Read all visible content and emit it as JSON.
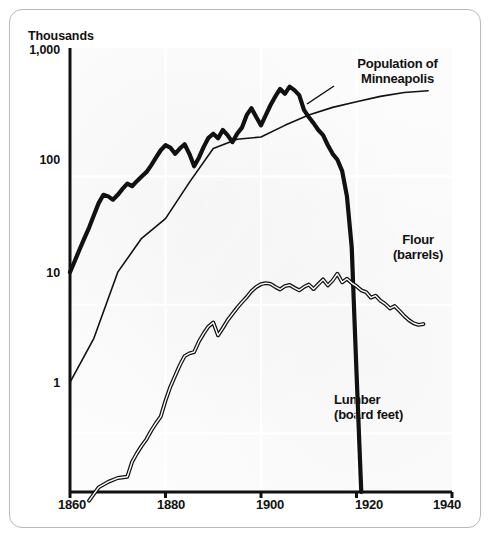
{
  "figure": {
    "border_color": "#b9b9b9",
    "background": "#ffffff"
  },
  "chart_data": {
    "type": "line",
    "title": "",
    "subtitle": "",
    "xlabel": "",
    "ylabel": "Thousands",
    "yscale": "log",
    "ylim": [
      0.35,
      1000
    ],
    "xlim": [
      1860,
      1940
    ],
    "grid": true,
    "legend_position": "inline-annotations",
    "y_ticks": [
      {
        "value": 1,
        "label": "1"
      },
      {
        "value": 10,
        "label": "10"
      },
      {
        "value": 100,
        "label": "100"
      },
      {
        "value": 1000,
        "label": "1,000"
      }
    ],
    "x_ticks": [
      {
        "value": 1860,
        "label": "1860"
      },
      {
        "value": 1880,
        "label": "1880"
      },
      {
        "value": 1900,
        "label": "1900"
      },
      {
        "value": 1920,
        "label": "1920"
      },
      {
        "value": 1940,
        "label": "1940"
      }
    ],
    "series": [
      {
        "name": "Lumber (board feet)",
        "label_line1": "Lumber",
        "label_line2": "(board feet)",
        "color": "#111111",
        "style": "thick-solid",
        "linewidth": 4.2,
        "points": [
          [
            1860,
            18
          ],
          [
            1861,
            22
          ],
          [
            1862,
            27
          ],
          [
            1863,
            33
          ],
          [
            1864,
            40
          ],
          [
            1865,
            50
          ],
          [
            1866,
            62
          ],
          [
            1867,
            72
          ],
          [
            1868,
            70
          ],
          [
            1869,
            66
          ],
          [
            1870,
            72
          ],
          [
            1871,
            80
          ],
          [
            1872,
            88
          ],
          [
            1873,
            84
          ],
          [
            1874,
            92
          ],
          [
            1875,
            100
          ],
          [
            1876,
            108
          ],
          [
            1877,
            122
          ],
          [
            1878,
            140
          ],
          [
            1879,
            160
          ],
          [
            1880,
            175
          ],
          [
            1881,
            168
          ],
          [
            1882,
            150
          ],
          [
            1883,
            165
          ],
          [
            1884,
            178
          ],
          [
            1885,
            150
          ],
          [
            1886,
            120
          ],
          [
            1887,
            140
          ],
          [
            1888,
            170
          ],
          [
            1889,
            200
          ],
          [
            1890,
            215
          ],
          [
            1891,
            198
          ],
          [
            1892,
            230
          ],
          [
            1893,
            210
          ],
          [
            1894,
            185
          ],
          [
            1895,
            215
          ],
          [
            1896,
            240
          ],
          [
            1897,
            300
          ],
          [
            1898,
            340
          ],
          [
            1899,
            290
          ],
          [
            1900,
            250
          ],
          [
            1901,
            300
          ],
          [
            1902,
            360
          ],
          [
            1903,
            420
          ],
          [
            1904,
            480
          ],
          [
            1905,
            440
          ],
          [
            1906,
            500
          ],
          [
            1907,
            470
          ],
          [
            1908,
            430
          ],
          [
            1909,
            330
          ],
          [
            1910,
            290
          ],
          [
            1911,
            260
          ],
          [
            1912,
            230
          ],
          [
            1913,
            210
          ],
          [
            1914,
            175
          ],
          [
            1915,
            150
          ],
          [
            1916,
            135
          ],
          [
            1917,
            110
          ],
          [
            1918,
            70
          ],
          [
            1919,
            28
          ],
          [
            1920,
            3
          ],
          [
            1921,
            0.35
          ]
        ]
      },
      {
        "name": "Population of Minneapolis",
        "label_line1": "Population of",
        "label_line2": "Minneapolis",
        "color": "#111111",
        "style": "thin-solid",
        "linewidth": 1.6,
        "points": [
          [
            1860,
            2.5
          ],
          [
            1865,
            5.5
          ],
          [
            1870,
            18
          ],
          [
            1875,
            33
          ],
          [
            1880,
            47
          ],
          [
            1885,
            90
          ],
          [
            1890,
            165
          ],
          [
            1895,
            195
          ],
          [
            1900,
            203
          ],
          [
            1905,
            250
          ],
          [
            1910,
            301
          ],
          [
            1915,
            345
          ],
          [
            1920,
            381
          ],
          [
            1925,
            420
          ],
          [
            1930,
            450
          ],
          [
            1935,
            465
          ]
        ]
      },
      {
        "name": "Flour (barrels)",
        "label_line1": "Flour",
        "label_line2": "(barrels)",
        "color": "#111111",
        "style": "double-outline",
        "linewidth": 2.6,
        "points": [
          [
            1864,
            0.3
          ],
          [
            1866,
            0.38
          ],
          [
            1868,
            0.42
          ],
          [
            1870,
            0.45
          ],
          [
            1872,
            0.46
          ],
          [
            1873,
            0.6
          ],
          [
            1874,
            0.7
          ],
          [
            1875,
            0.8
          ],
          [
            1876,
            0.9
          ],
          [
            1877,
            1.05
          ],
          [
            1878,
            1.2
          ],
          [
            1879,
            1.35
          ],
          [
            1880,
            1.8
          ],
          [
            1881,
            2.3
          ],
          [
            1882,
            2.8
          ],
          [
            1883,
            3.4
          ],
          [
            1884,
            4.0
          ],
          [
            1885,
            4.2
          ],
          [
            1886,
            4.3
          ],
          [
            1887,
            5.2
          ],
          [
            1888,
            6.0
          ],
          [
            1889,
            6.8
          ],
          [
            1890,
            7.3
          ],
          [
            1891,
            5.8
          ],
          [
            1892,
            6.6
          ],
          [
            1893,
            7.6
          ],
          [
            1894,
            8.5
          ],
          [
            1895,
            9.5
          ],
          [
            1896,
            10.5
          ],
          [
            1897,
            11.5
          ],
          [
            1898,
            12.8
          ],
          [
            1899,
            13.8
          ],
          [
            1900,
            14.5
          ],
          [
            1901,
            14.8
          ],
          [
            1902,
            14.6
          ],
          [
            1903,
            13.8
          ],
          [
            1904,
            13.2
          ],
          [
            1905,
            14.0
          ],
          [
            1906,
            14.3
          ],
          [
            1907,
            13.6
          ],
          [
            1908,
            13.0
          ],
          [
            1909,
            13.8
          ],
          [
            1910,
            14.4
          ],
          [
            1911,
            13.3
          ],
          [
            1912,
            14.5
          ],
          [
            1913,
            15.8
          ],
          [
            1914,
            14.2
          ],
          [
            1915,
            15.5
          ],
          [
            1916,
            17.5
          ],
          [
            1917,
            15.0
          ],
          [
            1918,
            16.0
          ],
          [
            1919,
            14.8
          ],
          [
            1920,
            14.0
          ],
          [
            1921,
            13.0
          ],
          [
            1922,
            12.6
          ],
          [
            1923,
            11.4
          ],
          [
            1924,
            11.8
          ],
          [
            1925,
            10.8
          ],
          [
            1926,
            10.2
          ],
          [
            1927,
            9.4
          ],
          [
            1928,
            9.8
          ],
          [
            1929,
            9.0
          ],
          [
            1930,
            8.2
          ],
          [
            1931,
            7.6
          ],
          [
            1932,
            7.2
          ],
          [
            1933,
            7.0
          ],
          [
            1934,
            7.1
          ]
        ]
      }
    ]
  },
  "annotations": {
    "population": {
      "line1": "Population of",
      "line2": "Minneapolis"
    },
    "flour": {
      "line1": "Flour",
      "line2": "(barrels)"
    },
    "lumber": {
      "line1": "Lumber",
      "line2": "(board feet)"
    }
  }
}
